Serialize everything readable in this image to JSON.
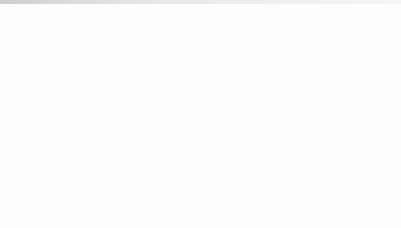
{
  "figure": {
    "caption_symbols": {
      "delta_v": "δV",
      "delta_b": "δB",
      "theta": "θ",
      "degree": "°",
      "k_label": "k",
      "b0_label": "B",
      "b0_sub": "0"
    },
    "colors": {
      "background": "#fdfdfd",
      "circle_stroke": "#2b2b31",
      "grid": "#c8c8cc",
      "vector_black": "#111114",
      "vector_gray": "#7d7d84",
      "vector_midgray": "#5d5d64",
      "text": "#15151a",
      "label_gray": "#5a5a60"
    },
    "axis_note": "dotted polar grid, unit circle"
  },
  "panels": [
    {
      "id": "a",
      "tag": "(a)",
      "quantity": "δV",
      "theta_text": "θ =5°",
      "theta_deg": 5,
      "title": "(a) δV , θ =5°",
      "labels": {
        "k": "k",
        "b0": "B",
        "b0sub": "0",
        "fast": "δV",
        "fast_sub": "f",
        "slow": "δV",
        "slow_sub": "s"
      },
      "show_corner_labels": true,
      "vectors": [
        {
          "name": "b0-vector",
          "angle_deg": 90,
          "length": 1.0,
          "color": "#111114",
          "width": 2.2
        },
        {
          "name": "k-vector",
          "angle_deg": 85,
          "length": 0.98,
          "color": "#4a4a51",
          "width": 1.5
        },
        {
          "name": "delta-v-fast-vector",
          "angle_deg": 180,
          "length": 0.97,
          "color": "#6f6f77",
          "width": 2.0
        },
        {
          "name": "delta-v-slow-vector",
          "angle_deg": 270,
          "length": 0.97,
          "color": "#5d5d64",
          "width": 2.0
        },
        {
          "name": "delta-v-alfven-vector",
          "angle_deg": 0,
          "length": 0.94,
          "color": "#cfcfd4",
          "width": 1.4
        }
      ]
    },
    {
      "id": "b",
      "tag": "(b)",
      "quantity": "δV",
      "theta_text": "θ =30°",
      "theta_deg": 30,
      "title": "(b) δV , θ =30°",
      "labels": {
        "k": "k",
        "b0": "B",
        "b0sub": "0",
        "fast": "δV",
        "fast_sub": "f",
        "slow": "δV",
        "slow_sub": "s"
      },
      "show_corner_labels": false,
      "vectors": [
        {
          "name": "b0-vector",
          "angle_deg": 90,
          "length": 1.0,
          "color": "#111114",
          "width": 2.2
        },
        {
          "name": "k-vector",
          "angle_deg": 118,
          "length": 0.92,
          "color": "#9a9aa1",
          "width": 2.0
        },
        {
          "name": "delta-v-fast-vector",
          "angle_deg": 186,
          "length": 0.97,
          "color": "#6f6f77",
          "width": 2.0
        },
        {
          "name": "delta-v-slow-vector",
          "angle_deg": 266,
          "length": 0.97,
          "color": "#5d5d64",
          "width": 2.0
        }
      ]
    },
    {
      "id": "c",
      "tag": "(c)",
      "quantity": "δV",
      "theta_text": "θ =60°",
      "theta_deg": 60,
      "title": "(c) δV , θ =60°",
      "labels": {
        "k": "k",
        "b0": "B",
        "b0sub": "0",
        "fast": "δV",
        "fast_sub": "f",
        "slow": "δV",
        "slow_sub": "s"
      },
      "show_corner_labels": false,
      "vectors": [
        {
          "name": "b0-vector",
          "angle_deg": 90,
          "length": 1.0,
          "color": "#111114",
          "width": 2.2
        },
        {
          "name": "k-vector",
          "angle_deg": 150,
          "length": 0.9,
          "color": "#9a9aa1",
          "width": 2.0
        },
        {
          "name": "delta-v-fast-vector",
          "angle_deg": 182,
          "length": 0.97,
          "color": "#6f6f77",
          "width": 2.0
        },
        {
          "name": "delta-v-slow-vector",
          "angle_deg": 271,
          "length": 0.97,
          "color": "#5d5d64",
          "width": 2.0
        }
      ]
    },
    {
      "id": "d",
      "tag": "(d)",
      "quantity": "δV",
      "theta_text": "θ =85°",
      "theta_deg": 85,
      "title": "(d) δV , θ =85°",
      "labels": {
        "k": "k",
        "b0": "B",
        "b0sub": "0",
        "fast": "δV",
        "fast_sub": "f",
        "slow": "δV",
        "slow_sub": "s"
      },
      "show_corner_labels": false,
      "vectors": [
        {
          "name": "b0-vector",
          "angle_deg": 90,
          "length": 1.0,
          "color": "#111114",
          "width": 2.2
        },
        {
          "name": "k-vector",
          "angle_deg": 175,
          "length": 0.93,
          "color": "#9a9aa1",
          "width": 2.0
        },
        {
          "name": "delta-v-fast-vector",
          "angle_deg": 180,
          "length": 0.97,
          "color": "#6f6f77",
          "width": 2.2
        },
        {
          "name": "delta-v-slow-vector",
          "angle_deg": 272,
          "length": 0.97,
          "color": "#5d5d64",
          "width": 2.0
        }
      ]
    },
    {
      "id": "e",
      "tag": "(e)",
      "quantity": "δB",
      "theta_text": "θ =5°",
      "theta_deg": 5,
      "title": "(e) δB , θ =5°",
      "labels": {
        "k": "k",
        "b0": "B",
        "b0sub": "0",
        "fast": "δB",
        "fast_sub": "f",
        "slow": "δB",
        "slow_sub": "s"
      },
      "show_corner_labels": true,
      "vectors": [
        {
          "name": "b0-vector",
          "angle_deg": 90,
          "length": 1.0,
          "color": "#111114",
          "width": 2.2
        },
        {
          "name": "k-vector",
          "angle_deg": 85,
          "length": 0.98,
          "color": "#4a4a51",
          "width": 1.5
        },
        {
          "name": "delta-b-fast-vector",
          "angle_deg": 80,
          "length": 0.96,
          "color": "#8a8a91",
          "width": 1.8
        },
        {
          "name": "delta-b-slow-vector",
          "angle_deg": 4,
          "length": 0.95,
          "color": "#5d5d64",
          "width": 2.0
        }
      ]
    },
    {
      "id": "f",
      "tag": "(f)",
      "quantity": "δB",
      "theta_text": "θ =30°",
      "theta_deg": 30,
      "title": "(f) δB , θ =30°",
      "labels": {
        "k": "k",
        "b0": "B",
        "b0sub": "0",
        "fast": "δB",
        "fast_sub": "f",
        "slow": "δB",
        "slow_sub": "s"
      },
      "show_corner_labels": false,
      "vectors": [
        {
          "name": "b0-vector",
          "angle_deg": 90,
          "length": 1.0,
          "color": "#111114",
          "width": 2.2
        },
        {
          "name": "delta-b-fast-vector",
          "angle_deg": 118,
          "length": 0.93,
          "color": "#9a9aa1",
          "width": 2.0
        },
        {
          "name": "delta-b-slow-vector",
          "angle_deg": 28,
          "length": 0.94,
          "color": "#6f6f77",
          "width": 2.0
        }
      ]
    },
    {
      "id": "g",
      "tag": "(g)",
      "quantity": "δB",
      "theta_text": "θ =60°",
      "theta_deg": 60,
      "title": "(g) δB , θ =60°",
      "labels": {
        "k": "k",
        "b0": "B",
        "b0sub": "0",
        "fast": "δB",
        "fast_sub": "f",
        "slow": "δB",
        "slow_sub": "s"
      },
      "show_corner_labels": false,
      "vectors": [
        {
          "name": "b0-vector",
          "angle_deg": 90,
          "length": 1.0,
          "color": "#111114",
          "width": 2.2
        },
        {
          "name": "delta-b-fast-vector",
          "angle_deg": 150,
          "length": 0.9,
          "color": "#9a9aa1",
          "width": 2.0
        },
        {
          "name": "delta-b-slow-vector",
          "angle_deg": 58,
          "length": 0.92,
          "color": "#6f6f77",
          "width": 2.0
        }
      ]
    },
    {
      "id": "h",
      "tag": "(h)",
      "quantity": "δB",
      "theta_text": "θ =85°",
      "theta_deg": 85,
      "title": "(h) δB , θ =85°",
      "labels": {
        "k": "k",
        "b0": "B",
        "b0sub": "0",
        "fast": "δB",
        "fast_sub": "f",
        "slow": "δB",
        "slow_sub": "s"
      },
      "show_corner_labels": false,
      "vectors": [
        {
          "name": "b0-vector",
          "angle_deg": 90,
          "length": 1.0,
          "color": "#111114",
          "width": 2.2
        },
        {
          "name": "delta-b-fast-vector",
          "angle_deg": 178,
          "length": 0.62,
          "color": "#9a9aa1",
          "width": 1.8
        },
        {
          "name": "delta-b-slow-vector",
          "angle_deg": 88,
          "length": 0.95,
          "color": "#5d5d64",
          "width": 2.0
        }
      ]
    }
  ],
  "chart_data": {
    "type": "scatter",
    "xlabel": "",
    "ylabel": "",
    "grid": true,
    "legend_position": "none",
    "axis_note": "Each panel is a unit circle with dotted polar grid; vectors drawn from center. Angles measured counter-clockwise from +x axis (degrees).",
    "panels": [
      {
        "panel": "a",
        "quantity": "deltaV",
        "theta_deg": 5,
        "vectors": [
          {
            "label": "B0",
            "angle_deg": 90,
            "magnitude": 1.0
          },
          {
            "label": "k",
            "angle_deg": 85,
            "magnitude": 0.98
          },
          {
            "label": "deltaV_f",
            "angle_deg": 180,
            "magnitude": 0.97
          },
          {
            "label": "deltaV_s",
            "angle_deg": 270,
            "magnitude": 0.97
          }
        ]
      },
      {
        "panel": "b",
        "quantity": "deltaV",
        "theta_deg": 30,
        "vectors": [
          {
            "label": "B0",
            "angle_deg": 90,
            "magnitude": 1.0
          },
          {
            "label": "k",
            "angle_deg": 118,
            "magnitude": 0.92
          },
          {
            "label": "deltaV_f",
            "angle_deg": 186,
            "magnitude": 0.97
          },
          {
            "label": "deltaV_s",
            "angle_deg": 266,
            "magnitude": 0.97
          }
        ]
      },
      {
        "panel": "c",
        "quantity": "deltaV",
        "theta_deg": 60,
        "vectors": [
          {
            "label": "B0",
            "angle_deg": 90,
            "magnitude": 1.0
          },
          {
            "label": "k",
            "angle_deg": 150,
            "magnitude": 0.9
          },
          {
            "label": "deltaV_f",
            "angle_deg": 182,
            "magnitude": 0.97
          },
          {
            "label": "deltaV_s",
            "angle_deg": 271,
            "magnitude": 0.97
          }
        ]
      },
      {
        "panel": "d",
        "quantity": "deltaV",
        "theta_deg": 85,
        "vectors": [
          {
            "label": "B0",
            "angle_deg": 90,
            "magnitude": 1.0
          },
          {
            "label": "k",
            "angle_deg": 175,
            "magnitude": 0.93
          },
          {
            "label": "deltaV_f",
            "angle_deg": 180,
            "magnitude": 0.97
          },
          {
            "label": "deltaV_s",
            "angle_deg": 272,
            "magnitude": 0.97
          }
        ]
      },
      {
        "panel": "e",
        "quantity": "deltaB",
        "theta_deg": 5,
        "vectors": [
          {
            "label": "B0",
            "angle_deg": 90,
            "magnitude": 1.0
          },
          {
            "label": "k",
            "angle_deg": 85,
            "magnitude": 0.98
          },
          {
            "label": "deltaB_f",
            "angle_deg": 80,
            "magnitude": 0.96
          },
          {
            "label": "deltaB_s",
            "angle_deg": 4,
            "magnitude": 0.95
          }
        ]
      },
      {
        "panel": "f",
        "quantity": "deltaB",
        "theta_deg": 30,
        "vectors": [
          {
            "label": "B0",
            "angle_deg": 90,
            "magnitude": 1.0
          },
          {
            "label": "deltaB_f",
            "angle_deg": 118,
            "magnitude": 0.93
          },
          {
            "label": "deltaB_s",
            "angle_deg": 28,
            "magnitude": 0.94
          }
        ]
      },
      {
        "panel": "g",
        "quantity": "deltaB",
        "theta_deg": 60,
        "vectors": [
          {
            "label": "B0",
            "angle_deg": 90,
            "magnitude": 1.0
          },
          {
            "label": "deltaB_f",
            "angle_deg": 150,
            "magnitude": 0.9
          },
          {
            "label": "deltaB_s",
            "angle_deg": 58,
            "magnitude": 0.92
          }
        ]
      },
      {
        "panel": "h",
        "quantity": "deltaB",
        "theta_deg": 85,
        "vectors": [
          {
            "label": "B0",
            "angle_deg": 90,
            "magnitude": 1.0
          },
          {
            "label": "deltaB_f",
            "angle_deg": 178,
            "magnitude": 0.62
          },
          {
            "label": "deltaB_s",
            "angle_deg": 88,
            "magnitude": 0.95
          }
        ]
      }
    ]
  }
}
